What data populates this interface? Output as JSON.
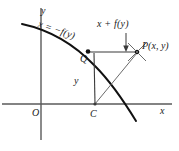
{
  "figure": {
    "kind": "coordinate-geometry-diagram",
    "background_color": "#ffffff",
    "ink_color": "#1a1a1a",
    "axis_color": "#555555",
    "labels": {
      "axis_x": "x",
      "axis_y": "y",
      "origin": "O",
      "curve_equation": "x = −f(y)",
      "segment_top": "x + f(y)",
      "segment_vertical": "y",
      "point_q": "Q",
      "point_c": "C",
      "point_p": "P(x, y)"
    },
    "geometry": {
      "origin": {
        "x": 41,
        "y": 104
      },
      "x_axis": {
        "x1": 2,
        "y1": 104,
        "x2": 172,
        "y2": 104
      },
      "y_axis": {
        "x1": 41,
        "y1": 8,
        "x2": 41,
        "y2": 140
      },
      "curve": "M22,24 C52,32 78,48 100,72 C116,89 126,104 135,120",
      "point_q": {
        "x": 88,
        "y": 52
      },
      "point_c": {
        "x": 95,
        "y": 104
      },
      "point_p": {
        "x": 137,
        "y": 52
      },
      "segment_qp": {
        "x1": 88,
        "y1": 52,
        "x2": 137,
        "y2": 52
      },
      "segment_qc": {
        "x1": 94,
        "y1": 54,
        "x2": 95,
        "y2": 104
      },
      "segment_cp": {
        "x1": 95,
        "y1": 104,
        "x2": 137,
        "y2": 52
      },
      "arrow": {
        "x": 126,
        "y1": 34,
        "y2": 50
      }
    }
  }
}
